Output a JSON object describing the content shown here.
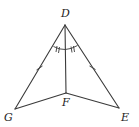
{
  "diagram": {
    "type": "geometry-figure",
    "points": {
      "D": {
        "label": "D",
        "x": 65,
        "y": 25
      },
      "G": {
        "label": "G",
        "x": 15,
        "y": 109
      },
      "E": {
        "label": "E",
        "x": 119,
        "y": 108
      },
      "F": {
        "label": "F",
        "x": 66,
        "y": 93
      }
    },
    "segments": [
      "DG",
      "DE",
      "DF",
      "GF",
      "FE"
    ],
    "markings": {
      "congruent_sides": [
        "DG",
        "DE"
      ],
      "side_tick_count": 1,
      "congruent_angles": [
        "GDF",
        "FDE"
      ],
      "angle_tick_count": 2
    },
    "colors": {
      "stroke": "#3a3a3a",
      "background": "#ffffff"
    }
  }
}
